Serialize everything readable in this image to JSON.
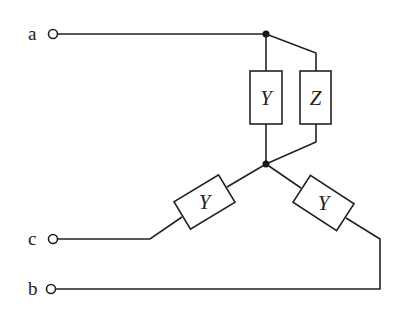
{
  "diagram": {
    "type": "three-phase circuit",
    "terminals": [
      {
        "id": "a",
        "label": "a"
      },
      {
        "id": "c",
        "label": "c"
      },
      {
        "id": "b",
        "label": "b"
      }
    ],
    "elements": [
      {
        "id": "y-vertical",
        "label": "Y"
      },
      {
        "id": "z-vertical",
        "label": "Z"
      },
      {
        "id": "y-left",
        "label": "Y"
      },
      {
        "id": "y-right",
        "label": "Y"
      }
    ],
    "nodes": [
      "top-node",
      "center-node"
    ]
  }
}
